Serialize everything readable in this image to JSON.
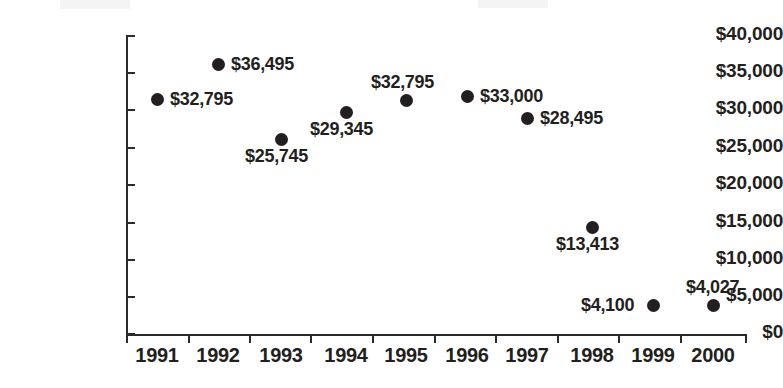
{
  "chart_data": {
    "type": "scatter",
    "title": "",
    "xlabel": "",
    "ylabel": "",
    "grid": false,
    "legend": null,
    "x": [
      "1991",
      "1992",
      "1993",
      "1994",
      "1995",
      "1996",
      "1997",
      "1998",
      "1999",
      "2000"
    ],
    "categories": [
      "1991",
      "1992",
      "1993",
      "1994",
      "1995",
      "1996",
      "1997",
      "1998",
      "1999",
      "2000"
    ],
    "values": [
      32795,
      36495,
      25745,
      29345,
      32795,
      33000,
      28495,
      13413,
      4100,
      4027
    ],
    "ylim": [
      0,
      40000
    ],
    "ytick_values": [
      0,
      5000,
      10000,
      15000,
      20000,
      25000,
      30000,
      35000,
      40000
    ],
    "ytick_labels": [
      "$0",
      "$5,000",
      "$10,000",
      "$15,000",
      "$20,000",
      "$25,000",
      "$30,000",
      "$35,000",
      "$40,000"
    ],
    "xtick_labels": [
      "1991",
      "1992",
      "1993",
      "1994",
      "1995",
      "1996",
      "1997",
      "1998",
      "1999",
      "2000"
    ],
    "marker": "filled-circle",
    "marker_color": "#231f20",
    "axis_color": "#2b2b2b",
    "points": [
      {
        "x": "1991",
        "value": 32795,
        "label": "$32,795",
        "px": 157,
        "py": 99,
        "label_x": 170,
        "label_y": 89,
        "label_align": "left"
      },
      {
        "x": "1992",
        "value": 36495,
        "label": "$36,495",
        "px": 218,
        "py": 64,
        "label_x": 231,
        "label_y": 54,
        "label_align": "left"
      },
      {
        "x": "1993",
        "value": 25745,
        "label": "$25,745",
        "px": 281,
        "py": 139,
        "label_x": 245,
        "label_y": 146,
        "label_align": "left"
      },
      {
        "x": "1994",
        "value": 29345,
        "label": "$29,345",
        "px": 346,
        "py": 112,
        "label_x": 310,
        "label_y": 119,
        "label_align": "left"
      },
      {
        "x": "1995",
        "value": 32795,
        "label": "$32,795",
        "px": 406,
        "py": 100,
        "label_x": 371,
        "label_y": 72,
        "label_align": "left"
      },
      {
        "x": "1996",
        "value": 33000,
        "label": "$33,000",
        "px": 467,
        "py": 96,
        "label_x": 480,
        "label_y": 86,
        "label_align": "left"
      },
      {
        "x": "1997",
        "value": 28495,
        "label": "$28,495",
        "px": 527,
        "py": 118,
        "label_x": 540,
        "label_y": 108,
        "label_align": "left"
      },
      {
        "x": "1998",
        "value": 13413,
        "label": "$13,413",
        "px": 592,
        "py": 227,
        "label_x": 556,
        "label_y": 234,
        "label_align": "left"
      },
      {
        "x": "1999",
        "value": 4100,
        "label": "$4,100",
        "px": 653,
        "py": 305,
        "label_x": 581,
        "label_y": 295,
        "label_align": "left"
      },
      {
        "x": "2000",
        "value": 4027,
        "label": "$4,027",
        "px": 713,
        "py": 305,
        "label_x": 686,
        "label_y": 277,
        "label_align": "left"
      }
    ]
  },
  "axes": {
    "y_ticks": [
      {
        "label": "$40,000",
        "value": 40000,
        "py": 36
      },
      {
        "label": "$35,000",
        "value": 35000,
        "py": 73
      },
      {
        "label": "$30,000",
        "value": 30000,
        "py": 110
      },
      {
        "label": "$25,000",
        "value": 25000,
        "py": 148
      },
      {
        "label": "$20,000",
        "value": 20000,
        "py": 185
      },
      {
        "label": "$15,000",
        "value": 15000,
        "py": 223
      },
      {
        "label": "$10,000",
        "value": 10000,
        "py": 260
      },
      {
        "label": "$5,000",
        "value": 5000,
        "py": 297
      },
      {
        "label": "$0",
        "value": 0,
        "py": 334
      }
    ],
    "x_ticks": [
      {
        "label": "1991",
        "px": 157
      },
      {
        "label": "1992",
        "px": 218
      },
      {
        "label": "1993",
        "px": 281
      },
      {
        "label": "1994",
        "px": 346
      },
      {
        "label": "1995",
        "px": 406
      },
      {
        "label": "1996",
        "px": 467
      },
      {
        "label": "1997",
        "px": 527
      },
      {
        "label": "1998",
        "px": 592
      },
      {
        "label": "1999",
        "px": 653
      },
      {
        "label": "2000",
        "px": 713
      }
    ],
    "x_tick_marks_px": [
      126,
      188,
      249,
      310,
      372,
      434,
      495,
      557,
      618,
      680,
      745
    ]
  }
}
